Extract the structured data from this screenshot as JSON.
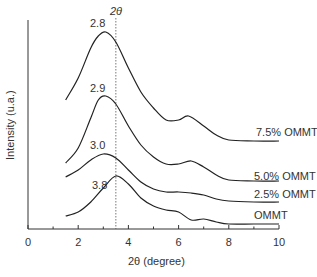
{
  "chart_data": {
    "type": "line",
    "title": "",
    "xlabel": "2θ (degree)",
    "ylabel": "Intensity (u.a.)",
    "xlim": [
      0,
      10
    ],
    "xticks": [
      0,
      2,
      4,
      6,
      8,
      10
    ],
    "xticks_minor": [
      1,
      3,
      5,
      7,
      9
    ],
    "grid": false,
    "legend_position": "inline-right",
    "reference_line": {
      "x": 3.5,
      "label": "2θ",
      "style": "dotted"
    },
    "series": [
      {
        "name": "7.5% OMMT",
        "peak_label": "2.8",
        "x": [
          1.5,
          2.0,
          2.5,
          2.8,
          3.1,
          3.5,
          4.0,
          4.5,
          5.0,
          5.5,
          6.0,
          6.4,
          7.0,
          7.5,
          8.0,
          9.0,
          10.0
        ],
        "y_px": [
          100,
          78,
          48,
          36,
          32,
          42,
          68,
          92,
          108,
          120,
          120,
          116,
          126,
          135,
          140,
          141,
          141
        ]
      },
      {
        "name": "5.0% OMMT",
        "peak_label": "2.9",
        "x": [
          1.5,
          2.0,
          2.5,
          2.8,
          3.1,
          3.5,
          4.0,
          4.5,
          5.0,
          5.5,
          6.0,
          6.5,
          7.0,
          7.5,
          8.0,
          9.0,
          10.0
        ],
        "y_px": [
          163,
          148,
          118,
          100,
          96,
          104,
          126,
          145,
          157,
          164,
          164,
          161,
          167,
          175,
          180,
          181,
          181
        ]
      },
      {
        "name": "2.5% OMMT",
        "peak_label": "3.0",
        "x": [
          1.5,
          2.0,
          2.5,
          3.0,
          3.5,
          4.0,
          4.5,
          5.0,
          5.5,
          6.0,
          6.5,
          7.0,
          7.5,
          8.0,
          9.0,
          10.0
        ],
        "y_px": [
          177,
          170,
          160,
          154,
          158,
          170,
          182,
          189,
          192,
          192,
          193,
          195,
          199,
          201,
          202,
          202
        ]
      },
      {
        "name": "OMMT",
        "peak_label": "3.8",
        "x": [
          1.5,
          2.0,
          2.5,
          3.0,
          3.5,
          4.0,
          4.5,
          5.0,
          5.5,
          6.0,
          6.5,
          7.0,
          7.5,
          8.0,
          9.0,
          10.0
        ],
        "y_px": [
          216,
          212,
          202,
          188,
          176,
          184,
          198,
          206,
          210,
          212,
          220,
          219,
          222,
          224,
          224,
          224
        ]
      }
    ]
  },
  "labels": {
    "ref_line_label": "2θ",
    "xlabel": "2θ (degree)",
    "ylabel": "Intensity (u.a.)",
    "peaks": [
      "2.8",
      "2.9",
      "3.0",
      "3.8"
    ],
    "series_names": [
      "7.5% OMMT",
      "5.0% OMMT",
      "2.5% OMMT",
      "OMMT"
    ],
    "xticks": [
      "0",
      "2",
      "4",
      "6",
      "8",
      "10"
    ]
  }
}
